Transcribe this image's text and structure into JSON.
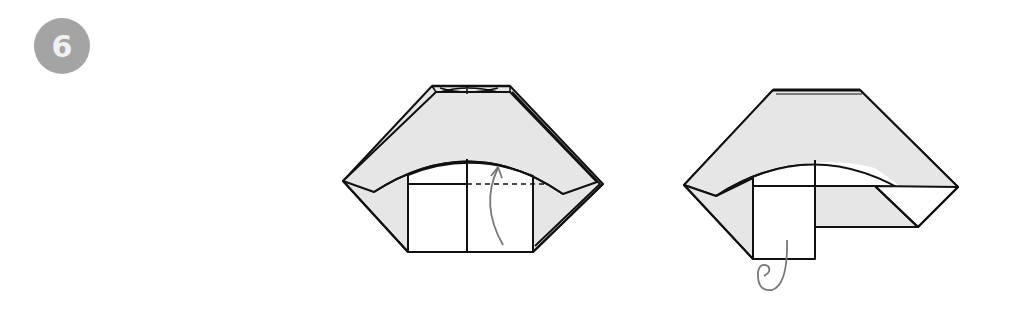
{
  "step": {
    "number": "6",
    "badge_color": "#a4a4a4"
  },
  "colors": {
    "paper_colored_side": "#e6e6e6",
    "paper_white_side": "#ffffff",
    "line": "#111111",
    "arrow": "#777777"
  },
  "figures": [
    {
      "id": "before",
      "description": "Valley fold the bottom-right square up along the dashed line",
      "annotations": [
        "valley-fold-dashed-line",
        "fold-up-arrow"
      ]
    },
    {
      "id": "after",
      "description": "Result: right flap folded up; fold behind indicated",
      "annotations": [
        "fold-behind-arrow"
      ]
    }
  ]
}
